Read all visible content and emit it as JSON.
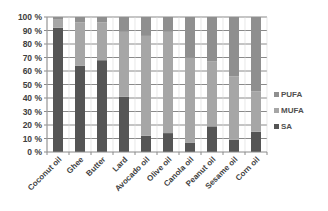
{
  "chart_data": {
    "type": "bar",
    "stacked": true,
    "percent_stacked": true,
    "title": "",
    "xlabel": "",
    "ylabel": "",
    "ylim": [
      0,
      100
    ],
    "y_ticks": [
      "0 %",
      "10 %",
      "20 %",
      "30 %",
      "40 %",
      "50 %",
      "60 %",
      "70 %",
      "80 %",
      "90 %",
      "100 %"
    ],
    "grid": true,
    "legend_position": "right",
    "categories": [
      "Coconut oil",
      "Ghee",
      "Butter",
      "Lard",
      "Avocado oil",
      "Olive oil",
      "Canola oil",
      "Peanut oil",
      "Sesame oil",
      "Corn oil"
    ],
    "series": [
      {
        "name": "SA",
        "color": "#555555",
        "values": [
          92,
          64,
          68,
          41,
          12,
          14,
          7,
          19,
          9,
          15
        ]
      },
      {
        "name": "MUFA",
        "color": "#a6a6a6",
        "values": [
          6,
          32,
          28,
          48,
          74,
          75,
          63,
          48,
          47,
          30
        ]
      },
      {
        "name": "PUFA",
        "color": "#8f8f8f",
        "values": [
          2,
          4,
          4,
          11,
          14,
          11,
          30,
          33,
          44,
          55
        ]
      }
    ],
    "legend": [
      "PUFA",
      "MUFA",
      "SA"
    ]
  }
}
